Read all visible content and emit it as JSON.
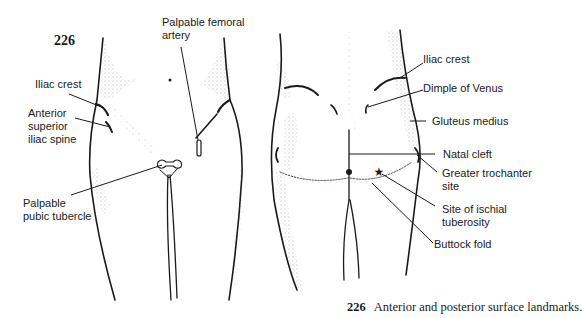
{
  "figure": {
    "number": "226",
    "caption_number": "226",
    "caption_text": "Anterior and posterior surface landmarks."
  },
  "anterior_view": {
    "labels": {
      "palpable_femoral_artery": "Palpable femoral\nartery",
      "iliac_crest": "Iliac crest",
      "anterior_superior_iliac_spine": "Anterior\nsuperior\niliac spine",
      "palpable_pubic_tubercle": "Palpable\npubic tubercle"
    }
  },
  "posterior_view": {
    "labels": {
      "iliac_crest": "Iliac crest",
      "dimple_of_venus": "Dimple of Venus",
      "gluteus_medius": "Gluteus medius",
      "natal_cleft": "Natal cleft",
      "greater_trochanter_site": "Greater trochanter\nsite",
      "site_of_ischial_tuberosity": "Site of ischial\ntuberosity",
      "buttock_fold": "Buttock fold"
    }
  },
  "colors": {
    "ink": "#1a1a1a",
    "stipple": "#555555",
    "background": "#ffffff"
  }
}
